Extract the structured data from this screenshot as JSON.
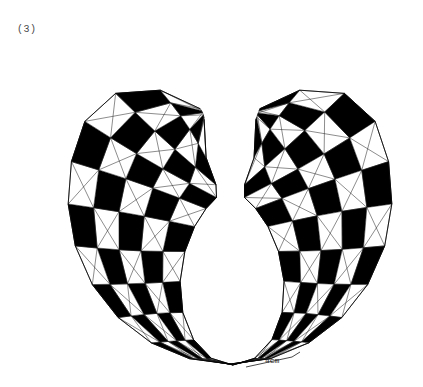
{
  "figure": {
    "panel_label": "(3)",
    "dimension_label": "4cm",
    "background_color": "#ffffff",
    "ink_color": "#000000",
    "mesh_line_color": "#222222",
    "label_color": "#4a4a4a",
    "canvas": {
      "width": 423,
      "height": 387
    },
    "description_type": "geometric-mesh-drawing",
    "shape": "toroidal checkerboard quadrilateral mesh with open top gap",
    "counts": {
      "rings_around": 22,
      "rings_across": 5
    },
    "geometry": {
      "outer_center": {
        "x": 230,
        "y": 196
      },
      "outer_radius_x": 162,
      "outer_radius_y": 168,
      "inner_center": {
        "x": 233,
        "y": 273
      },
      "inner_radius_x": 88,
      "inner_radius_y": 92,
      "pinch_point": {
        "x": 230,
        "y": 190
      },
      "left_horn_tip": {
        "x": 196,
        "y": 35
      },
      "right_horn_tip": {
        "x": 278,
        "y": 32
      },
      "bottom_vertex": {
        "x": 233,
        "y": 365
      },
      "gap_start_angle_deg": 250,
      "gap_end_angle_deg": 290
    },
    "dimension_leader": {
      "from": {
        "x": 292,
        "y": 357
      },
      "to": {
        "x": 246,
        "y": 367
      },
      "tail": {
        "x": 300,
        "y": 352
      }
    }
  }
}
